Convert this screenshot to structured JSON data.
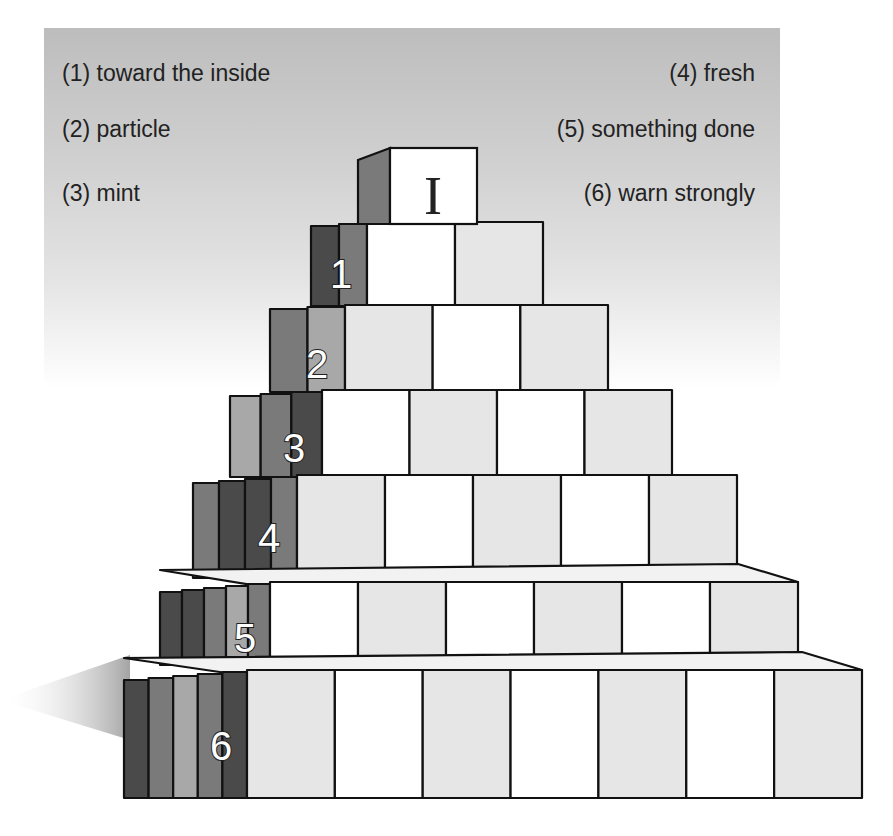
{
  "clues": {
    "left": [
      {
        "number": "(1)",
        "text": "(1) toward the inside"
      },
      {
        "number": "(2)",
        "text": "(2) particle"
      },
      {
        "number": "(3)",
        "text": "(3) mint"
      }
    ],
    "right": [
      {
        "number": "(4)",
        "text": "(4) fresh"
      },
      {
        "number": "(5)",
        "text": "(5) something done"
      },
      {
        "number": "(6)",
        "text": "(6) warn strongly"
      }
    ]
  },
  "pyramid": {
    "top_block_letter": "I",
    "rows": [
      {
        "label": "1",
        "boxes": 2
      },
      {
        "label": "2",
        "boxes": 3
      },
      {
        "label": "3",
        "boxes": 4
      },
      {
        "label": "4",
        "boxes": 5
      },
      {
        "label": "5",
        "boxes": 6
      },
      {
        "label": "6",
        "boxes": 7
      }
    ]
  },
  "colors": {
    "panel_top": "#bdbdbd",
    "box_face_white": "#ffffff",
    "box_face_gray": "#e6e6e6",
    "side_dark": "#4a4a4a",
    "side_mid": "#7a7a7a",
    "side_light": "#a8a8a8",
    "outline": "#111111"
  }
}
